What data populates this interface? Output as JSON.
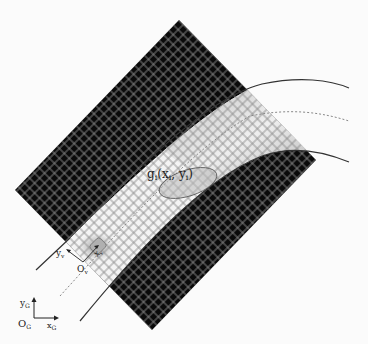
{
  "diagram": {
    "type": "occupancy-grid-road-diagram",
    "colors": {
      "background": "#fbfbfb",
      "occupied_cell": "#0a0a0a",
      "free_cell": "#f4f4f4",
      "grid_line": "#8c8c8c",
      "gradient_dark": "#707070",
      "gradient_light": "#e8e8e8",
      "road_line": "#333333",
      "centerline": "#888888",
      "ellipse_fill": "#b9b9b9",
      "vehicle_glow": "#a0a0a0"
    },
    "labels": {
      "gaussian": "g",
      "gaussian_sub": "i",
      "gaussian_args_open": "(x",
      "gaussian_args_x_sub": "i",
      "gaussian_args_mid": ", y",
      "gaussian_args_y_sub": "i",
      "gaussian_args_close": ")",
      "vehicle_origin": "O",
      "vehicle_origin_sub": "v",
      "vehicle_y": "y",
      "vehicle_y_sub": "v",
      "vehicle_x": "x",
      "vehicle_x_sub": "v",
      "global_origin": "O",
      "global_origin_sub": "G",
      "global_y": "y",
      "global_y_sub": "G",
      "global_x": "x",
      "global_x_sub": "G"
    },
    "elements": [
      "rotated occupancy grid",
      "occupied (black) regions on both sides of road",
      "free road corridor",
      "cost gradient region ahead of vehicle",
      "left road boundary curve",
      "right road boundary curve",
      "dotted centerline",
      "gaussian ellipse g_i(x_i, y_i)",
      "vehicle local frame O_v",
      "global frame O_G"
    ]
  }
}
